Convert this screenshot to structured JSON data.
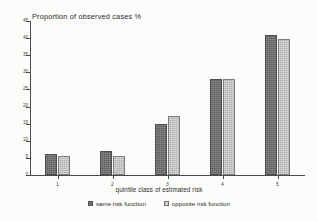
{
  "chart_data": {
    "type": "bar",
    "title": "Proportion of observed cases %",
    "xlabel": "quintile class of estimated risk",
    "ylabel": "",
    "categories": [
      "1",
      "2",
      "3",
      "4",
      "5"
    ],
    "series": [
      {
        "name": "same risk function",
        "color": "#6e6e6e",
        "values": [
          6.0,
          7.0,
          14.8,
          28.2,
          41.0
        ]
      },
      {
        "name": "opposite risk function",
        "color": "#c3c3c3",
        "values": [
          5.5,
          5.7,
          17.3,
          28.2,
          39.8
        ]
      }
    ],
    "ylim": [
      0,
      45
    ],
    "ytick_step": 5,
    "yticks": [
      "0",
      "5",
      "10",
      "15",
      "20",
      "25",
      "30",
      "35",
      "40",
      "45"
    ],
    "grid": false,
    "legend_position": "bottom-center"
  },
  "legend": {
    "entries": [
      {
        "label": "same risk function",
        "swatch": "dark-gray-swatch"
      },
      {
        "label": "opposite risk function",
        "swatch": "light-gray-swatch"
      }
    ]
  }
}
